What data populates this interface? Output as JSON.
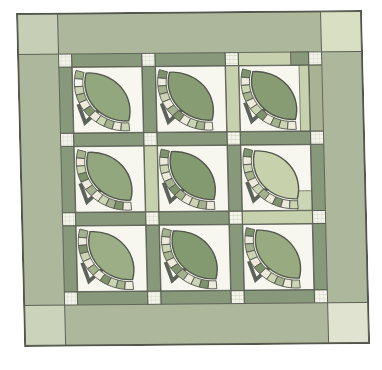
{
  "illustration": {
    "description": "Quilt illustration: 3x3 grid of leaf fan blocks with pieced arcs, sashing with gingham cornerstones, green outer border with corner squares",
    "outline_color": "#53564d",
    "page_background": "#ffffff",
    "border": {
      "color": "#adb79c",
      "corner_squares": {
        "tl": "#c6cfb5",
        "tr": "#d9dfc2",
        "bl": "#cbd4ba",
        "br": "#dfe3d0"
      }
    },
    "sashing": {
      "colors": {
        "dark": "#88987b",
        "light": "#c7d1ae",
        "medium": "#a9b394"
      },
      "horizontal_rows": [
        [
          "dark",
          "dark",
          "light_darkend"
        ],
        [
          "dark",
          "dark",
          "dark"
        ],
        [
          "dark",
          "dark",
          "light"
        ],
        [
          "dark",
          "dark",
          "dark"
        ]
      ],
      "vertical_cols": [
        [
          "dark",
          "dark",
          "dark"
        ],
        [
          "dark",
          "light",
          "dark"
        ],
        [
          "light",
          "dark",
          "dark"
        ],
        [
          "medium",
          "dark",
          "dark"
        ]
      ]
    },
    "cornerstone": {
      "bg": "#f4f4ed",
      "grid": "#d6ddc4"
    },
    "block": {
      "bg": "#f7f7f0",
      "stem_color": "#5c635a",
      "gap_color": "#f7f7f0"
    },
    "blocks": [
      {
        "leaf": "#92a77e",
        "keys": [
          "#a3b28d",
          "#f6f5ee",
          "#cbd5b4",
          "#a3b28d",
          "#eeebdc",
          "#7e926c",
          "#eeebdc",
          "#cbd5b4",
          "#a3b28d",
          "#eeebdc",
          "#cbd5b4"
        ]
      },
      {
        "leaf": "#879c72",
        "keys": [
          "#7e926c",
          "#eeebdc",
          "#a3b28d",
          "#cbd5b4",
          "#eeebdc",
          "#a3b28d",
          "#7e926c",
          "#eeebdc",
          "#cbd5b4",
          "#a3b28d",
          "#eeebdc"
        ]
      },
      {
        "leaf": "#879c72",
        "keys": [
          "#7e926c",
          "#eeebdc",
          "#cbd5b4",
          "#a3b28d",
          "#eeebdc",
          "#cbd5b4",
          "#7e926c",
          "#eeebdc",
          "#a3b28d",
          "#cbd5b4",
          "#eeebdc"
        ],
        "right_strip": "#c7d1ae"
      },
      {
        "leaf": "#92a77e",
        "keys": [
          "#a3b28d",
          "#eeebdc",
          "#cbd5b4",
          "#7e926c",
          "#eeebdc",
          "#a3b28d",
          "#eeebdc",
          "#cbd5b4",
          "#a3b28d",
          "#7e926c",
          "#eeebdc"
        ]
      },
      {
        "leaf": "#839970",
        "keys": [
          "#7e926c",
          "#eeebdc",
          "#cbd5b4",
          "#eeebdc",
          "#a3b28d",
          "#7e926c",
          "#a3b28d",
          "#eeebdc",
          "#cbd5b4",
          "#a3b28d",
          "#eeebdc"
        ]
      },
      {
        "leaf": "#c7d1ab",
        "keys": [
          "#7e926c",
          "#eeebdc",
          "#cbd5b4",
          "#a3b28d",
          "#eeebdc",
          "#cbd5b4",
          "#a3b28d",
          "#eeebdc",
          "#7e926c",
          "#eeebdc",
          "#cbd5b4"
        ],
        "corner_patch": "#ccd6b6"
      },
      {
        "leaf": "#9cae85",
        "keys": [
          "#a3b28d",
          "#eeebdc",
          "#7e926c",
          "#cbd5b4",
          "#eeebdc",
          "#a3b28d",
          "#eeebdc",
          "#7e926c",
          "#cbd5b4",
          "#a3b28d",
          "#eeebdc"
        ]
      },
      {
        "leaf": "#839970",
        "keys": [
          "#a3b28d",
          "#eeebdc",
          "#cbd5b4",
          "#a3b28d",
          "#eeebdc",
          "#7e926c",
          "#a3b28d",
          "#eeebdc",
          "#cbd5b4",
          "#7e926c",
          "#eeebdc"
        ]
      },
      {
        "leaf": "#97aa80",
        "keys": [
          "#7e926c",
          "#eeebdc",
          "#a3b28d",
          "#cbd5b4",
          "#eeebdc",
          "#7e926c",
          "#eeebdc",
          "#cbd5b4",
          "#a3b28d",
          "#eeebdc",
          "#cbd5b4"
        ]
      }
    ]
  }
}
